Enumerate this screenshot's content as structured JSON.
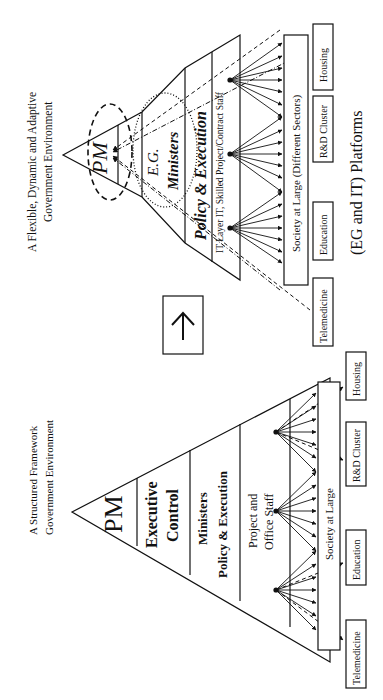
{
  "figure": {
    "arrow_icon": "up-arrow-icon",
    "structured": {
      "title_line1": "A Structured  Framework",
      "title_line2": "Government  Environment",
      "levels": {
        "pm": "PM",
        "exec_line1": "Executive",
        "exec_line2": "Control",
        "ministers_line1": "Ministers",
        "ministers_line2": "Policy & Execution",
        "staff_line1": "Project and",
        "staff_line2": "Office Staff"
      },
      "society": "Society at Large",
      "sectors": [
        "Telemedicine",
        "Education",
        "R&D Cluster",
        "Housing"
      ]
    },
    "flexible": {
      "title_line1": "A Flexible, Dynamic and Adaptive",
      "title_line2": "Government Environment",
      "levels": {
        "pm": "PM",
        "eg": "E.G.",
        "ministers": "Ministers",
        "policy": "Policy & Execution",
        "it_layer": "IT Layer IT, Skilled Project/Contract Staff"
      },
      "society": "Society at Large (Different Sectors)",
      "sectors": [
        "Telemedicine",
        "Education",
        "R&D Cluster",
        "Housing"
      ],
      "caption": "(EG and IT) Platforms"
    }
  }
}
